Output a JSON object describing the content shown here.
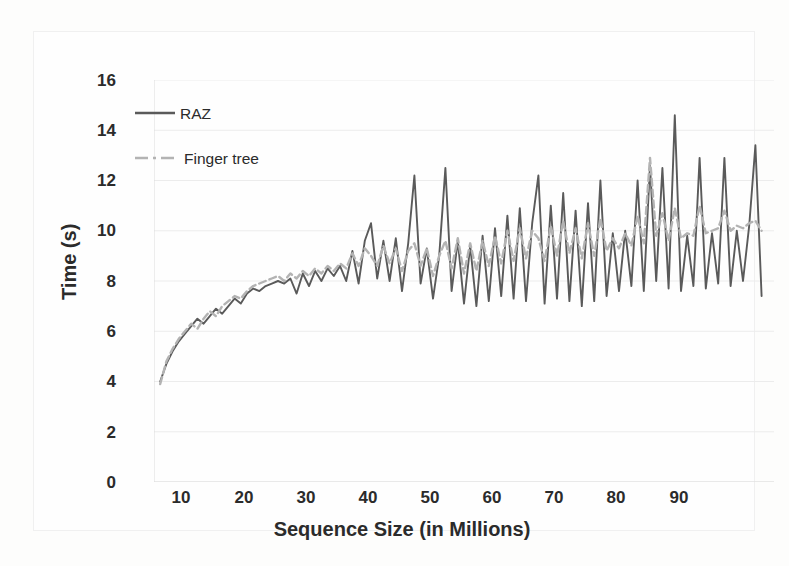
{
  "chart_data": {
    "type": "line",
    "title": "",
    "subtitle": "",
    "xlabel": "Sequence Size (in Millions)",
    "ylabel": "Time (s)",
    "xlim": [
      0,
      100
    ],
    "ylim": [
      0,
      16
    ],
    "xticks": [
      10,
      20,
      30,
      40,
      50,
      60,
      70,
      80,
      90
    ],
    "yticks": [
      0,
      2,
      4,
      6,
      8,
      10,
      12,
      14,
      16
    ],
    "grid": "horizontal-only-faint",
    "legend_position": "inside-upper-left",
    "colors": {
      "raz": "#5a5a5a",
      "finger_tree": "#b3b3b3",
      "gridline": "#ececec",
      "text": "#2b2b2b",
      "background": "#fefefe"
    },
    "legend": [
      {
        "label": "RAZ",
        "style": "solid",
        "color": "#5a5a5a"
      },
      {
        "label": "Finger tree",
        "style": "dashed",
        "color": "#b3b3b3"
      }
    ],
    "series": [
      {
        "name": "RAZ",
        "style": "solid",
        "color": "#5a5a5a",
        "x": [
          1,
          2,
          3,
          4,
          5,
          6,
          7,
          8,
          9,
          10,
          11,
          12,
          13,
          14,
          15,
          16,
          17,
          18,
          19,
          20,
          21,
          22,
          23,
          24,
          25,
          26,
          27,
          28,
          29,
          30,
          31,
          32,
          33,
          34,
          35,
          36,
          37,
          38,
          39,
          40,
          41,
          42,
          43,
          44,
          45,
          46,
          47,
          48,
          49,
          50,
          51,
          52,
          53,
          54,
          55,
          56,
          57,
          58,
          59,
          60,
          61,
          62,
          63,
          64,
          65,
          66,
          67,
          68,
          69,
          70,
          71,
          72,
          73,
          74,
          75,
          76,
          77,
          78,
          79,
          80,
          81,
          82,
          83,
          84,
          85,
          86,
          87,
          88,
          89,
          90,
          91,
          92,
          93,
          94,
          95,
          96,
          97,
          98
        ],
        "y": [
          4.0,
          4.7,
          5.2,
          5.6,
          5.9,
          6.2,
          6.5,
          6.3,
          6.6,
          6.9,
          6.7,
          7.0,
          7.3,
          7.1,
          7.5,
          7.7,
          7.6,
          7.8,
          7.9,
          8.0,
          7.9,
          8.1,
          7.5,
          8.3,
          7.8,
          8.4,
          8.0,
          8.5,
          8.2,
          8.6,
          8.0,
          9.2,
          7.9,
          9.6,
          10.3,
          8.1,
          9.6,
          8.0,
          9.7,
          7.6,
          9.5,
          12.2,
          7.9,
          9.3,
          7.3,
          9.0,
          12.5,
          7.6,
          9.6,
          7.1,
          9.4,
          7.0,
          9.8,
          7.2,
          10.1,
          7.4,
          10.6,
          7.3,
          10.9,
          7.2,
          10.3,
          12.2,
          7.1,
          11.0,
          7.3,
          11.5,
          7.2,
          10.8,
          7.0,
          11.1,
          7.2,
          12.0,
          7.4,
          9.9,
          7.6,
          10.0,
          7.8,
          12.0,
          7.6,
          12.6,
          8.0,
          12.5,
          7.7,
          14.6,
          7.6,
          9.8,
          7.8,
          12.9,
          7.7,
          9.9,
          7.9,
          12.9,
          7.8,
          10.0,
          8.0,
          10.2,
          13.4,
          7.4
        ]
      },
      {
        "name": "Finger tree",
        "style": "dashed",
        "color": "#b3b3b3",
        "x": [
          1,
          2,
          3,
          4,
          5,
          6,
          7,
          8,
          9,
          10,
          11,
          12,
          13,
          14,
          15,
          16,
          17,
          18,
          19,
          20,
          21,
          22,
          23,
          24,
          25,
          26,
          27,
          28,
          29,
          30,
          31,
          32,
          33,
          34,
          35,
          36,
          37,
          38,
          39,
          40,
          41,
          42,
          43,
          44,
          45,
          46,
          47,
          48,
          49,
          50,
          51,
          52,
          53,
          54,
          55,
          56,
          57,
          58,
          59,
          60,
          61,
          62,
          63,
          64,
          65,
          66,
          67,
          68,
          69,
          70,
          71,
          72,
          73,
          74,
          75,
          76,
          77,
          78,
          79,
          80,
          81,
          82,
          83,
          84,
          85,
          86,
          87,
          88,
          89,
          90,
          91,
          92,
          93,
          94,
          95,
          96,
          97,
          98
        ],
        "y": [
          3.9,
          4.8,
          5.3,
          5.7,
          6.0,
          6.3,
          6.1,
          6.5,
          6.8,
          6.6,
          7.0,
          7.2,
          7.4,
          7.3,
          7.6,
          7.8,
          7.9,
          8.0,
          8.1,
          8.2,
          8.0,
          8.3,
          8.1,
          8.4,
          8.2,
          8.5,
          8.3,
          8.6,
          8.4,
          8.7,
          8.5,
          9.1,
          8.6,
          9.3,
          9.0,
          8.6,
          9.4,
          8.7,
          9.3,
          8.4,
          9.2,
          9.5,
          8.6,
          9.3,
          8.2,
          9.0,
          9.6,
          8.5,
          9.7,
          8.3,
          9.5,
          8.4,
          9.6,
          8.6,
          9.8,
          8.7,
          10.0,
          8.8,
          10.1,
          8.9,
          10.0,
          9.7,
          8.8,
          10.2,
          9.0,
          10.4,
          9.1,
          10.1,
          8.9,
          10.3,
          9.0,
          10.5,
          9.2,
          9.7,
          9.3,
          9.9,
          9.4,
          10.6,
          9.5,
          12.9,
          9.8,
          10.7,
          9.6,
          10.9,
          9.7,
          9.9,
          9.8,
          11.0,
          9.9,
          10.0,
          10.1,
          10.8,
          10.0,
          10.2,
          10.1,
          10.3,
          10.4,
          10.0
        ]
      }
    ],
    "annotations": [
      {
        "text": "peak",
        "x": 84,
        "y": 14.6,
        "series": "RAZ"
      },
      {
        "text": "peak",
        "x": 97,
        "y": 13.4,
        "series": "RAZ"
      },
      {
        "text": "peak",
        "x": 80,
        "y": 12.9,
        "series": "Finger tree"
      }
    ]
  }
}
